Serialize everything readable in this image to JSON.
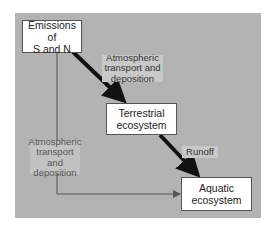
{
  "diagram": {
    "nodes": {
      "emissions": {
        "line1": "Emissions of",
        "line2": "S and N"
      },
      "terrestrial": {
        "line1": "Terrestrial",
        "line2": "ecosystem"
      },
      "aquatic": {
        "line1": "Aquatic",
        "line2": "ecosystem"
      }
    },
    "edge_labels": {
      "atmo_upper": {
        "line1": "Atmospheric",
        "line2": "transport and",
        "line3": "deposition"
      },
      "atmo_lower": {
        "line1": "Atmospheric",
        "line2": "transport and",
        "line3": "deposition"
      },
      "runoff": "Runoff"
    },
    "edges": [
      {
        "from": "emissions",
        "to": "terrestrial",
        "label": "Atmospheric transport and deposition",
        "style": "thick"
      },
      {
        "from": "terrestrial",
        "to": "aquatic",
        "label": "Runoff",
        "style": "thick"
      },
      {
        "from": "emissions",
        "to": "aquatic",
        "label": "Atmospheric transport and deposition",
        "style": "thin"
      }
    ],
    "colors": {
      "panel": "#b3b3b3",
      "label_bg": "#c9c9c9",
      "thick_arrow": "#111111",
      "thin_arrow": "#555555"
    }
  }
}
